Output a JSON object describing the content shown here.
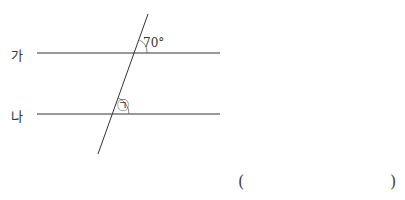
{
  "diagram": {
    "lines": [
      {
        "label": "가",
        "y": 53
      },
      {
        "label": "나",
        "y": 114
      }
    ],
    "angle_given": "70°",
    "angle_unknown": "㉠"
  },
  "answer": {
    "open_paren": "(",
    "close_paren": ")"
  }
}
